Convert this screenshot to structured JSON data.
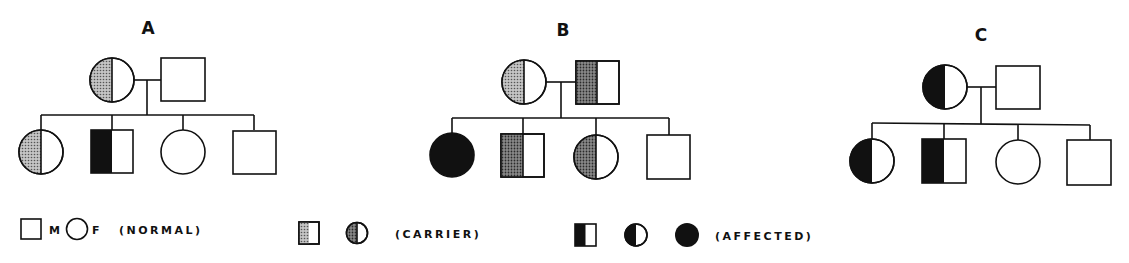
{
  "diagram": {
    "type": "pedigree-chart",
    "colors": {
      "ink": "#111111",
      "carrier_fill": "#9a9a9a",
      "paper": "#ffffff"
    },
    "pedigrees": [
      {
        "label": "A",
        "parents": [
          {
            "sex": "female",
            "status": "carrier"
          },
          {
            "sex": "male",
            "status": "normal"
          }
        ],
        "children": [
          {
            "sex": "female",
            "status": "carrier"
          },
          {
            "sex": "male",
            "status": "affected"
          },
          {
            "sex": "female",
            "status": "normal"
          },
          {
            "sex": "male",
            "status": "normal"
          }
        ]
      },
      {
        "label": "B",
        "parents": [
          {
            "sex": "female",
            "status": "carrier"
          },
          {
            "sex": "male",
            "status": "carrier"
          }
        ],
        "children": [
          {
            "sex": "female",
            "status": "affected-full"
          },
          {
            "sex": "male",
            "status": "carrier"
          },
          {
            "sex": "female",
            "status": "carrier"
          },
          {
            "sex": "male",
            "status": "normal"
          }
        ]
      },
      {
        "label": "C",
        "parents": [
          {
            "sex": "female",
            "status": "affected"
          },
          {
            "sex": "male",
            "status": "normal"
          }
        ],
        "children": [
          {
            "sex": "female",
            "status": "affected"
          },
          {
            "sex": "male",
            "status": "affected"
          },
          {
            "sex": "female",
            "status": "normal"
          },
          {
            "sex": "male",
            "status": "normal"
          }
        ]
      }
    ]
  },
  "legend": {
    "normal": {
      "male_label": "M",
      "female_label": "F",
      "text": "(NORMAL)"
    },
    "carrier": {
      "text": "(CARRIER)"
    },
    "affected": {
      "text": "(AFFECTED)"
    }
  }
}
